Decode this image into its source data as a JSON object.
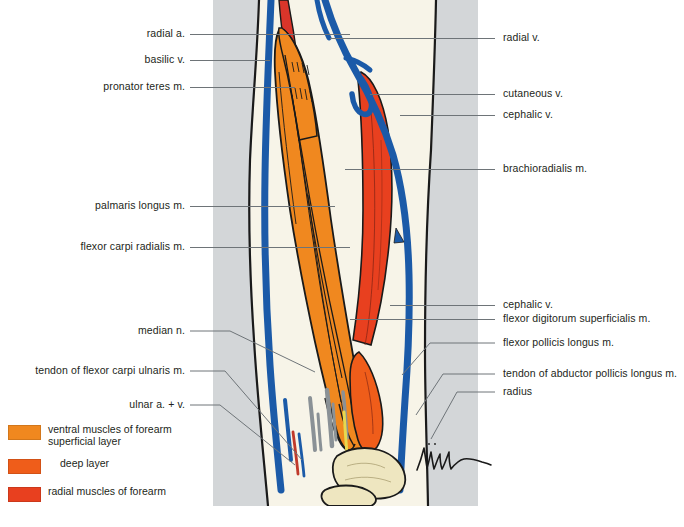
{
  "figure": {
    "signature": "Müller",
    "panel_background": "#d3d6d8"
  },
  "colors": {
    "superficial_muscle": "#f0881f",
    "deep_muscle": "#ef5d1a",
    "radial_muscle": "#e8401f",
    "vein_blue": "#1b5aa8",
    "artery_red": "#d9352a",
    "nerve_gray": "#8a9196",
    "nerve_yellow": "#e8d84e",
    "bone_cream": "#eee6c0",
    "skin_cream": "#f7f4e8",
    "outline": "#1a1a1a",
    "leader_line": "#6e7478",
    "text": "#231f20"
  },
  "labels_left": [
    {
      "id": "radial-a",
      "text": "radial a.",
      "y": 34
    },
    {
      "id": "basilic-v",
      "text": "basilic v.",
      "y": 60
    },
    {
      "id": "pronator-teres-m",
      "text": "pronator teres m.",
      "y": 87
    },
    {
      "id": "palmaris-longus-m",
      "text": "palmaris longus m.",
      "y": 206
    },
    {
      "id": "flexor-carpi-radialis-m",
      "text": "flexor carpi radialis m.",
      "y": 247
    },
    {
      "id": "median-n",
      "text": "median n.",
      "y": 331
    },
    {
      "id": "tendon-of-flexor-carpi-ulnaris-m",
      "text": "tendon of flexor carpi ulnaris m.",
      "y": 371
    },
    {
      "id": "ulnar-a-v",
      "text": "ulnar a. + v.",
      "y": 405
    }
  ],
  "labels_right": [
    {
      "id": "radial-v",
      "text": "radial v.",
      "y": 38
    },
    {
      "id": "cutaneous-v",
      "text": "cutaneous v.",
      "y": 94
    },
    {
      "id": "cephalic-v-upper",
      "text": "cephalic v.",
      "y": 115
    },
    {
      "id": "brachioradialis-m",
      "text": "brachioradialis m.",
      "y": 169
    },
    {
      "id": "cephalic-v-lower",
      "text": "cephalic v.",
      "y": 305
    },
    {
      "id": "flexor-digitorum-superficialis-m",
      "text": "flexor digitorum superficialis m.",
      "y": 319
    },
    {
      "id": "flexor-pollicis-longus-m",
      "text": "flexor pollicis longus m.",
      "y": 343
    },
    {
      "id": "tendon-of-abductor-pollicis-longus-m",
      "text": "tendon of abductor pollicis longus m.",
      "y": 374
    },
    {
      "id": "radius",
      "text": "radius",
      "y": 392
    }
  ],
  "legend": {
    "items": [
      {
        "id": "ventral-superficial",
        "label": "ventral muscles of forearm\n   superficial layer",
        "color": "#f0881f"
      },
      {
        "id": "deep-layer",
        "label": "deep layer",
        "color": "#ef5d1a"
      },
      {
        "id": "radial-muscles",
        "label": "radial muscles of forearm",
        "color": "#e8401f"
      }
    ]
  }
}
